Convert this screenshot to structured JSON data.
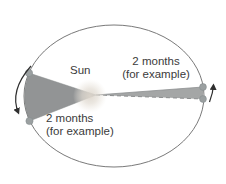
{
  "colors": {
    "wedge_fill": "#929495",
    "sliver_fill": "#a4a6a6",
    "ellipse_stroke": "#6a6a6a",
    "planet_dot": "#9ba0a1",
    "dot_edge": "#878d8f",
    "arrow": "#2f2f2f",
    "text": "#3b3b3b",
    "sun_glow": "#e0dad1",
    "background": "#ffffff"
  },
  "diagram": {
    "sun_label": "Sun",
    "aphelion_sweep_label": {
      "line1": "2 months",
      "line2": "(for example)"
    },
    "perihelion_sweep_label": {
      "line1": "2 months",
      "line2": "(for example)"
    }
  }
}
